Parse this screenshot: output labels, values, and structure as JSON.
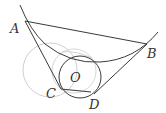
{
  "diagram": {
    "labels": {
      "A": "A",
      "B": "B",
      "C": "C",
      "D": "D",
      "O": "O"
    },
    "colors": {
      "main": "#3a3a3a",
      "faint": "#c8c8c8"
    }
  }
}
